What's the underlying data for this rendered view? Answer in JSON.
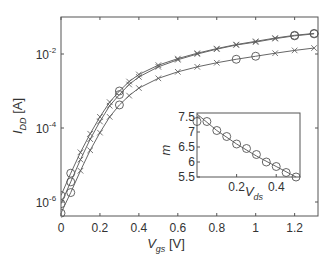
{
  "chart_data": [
    {
      "type": "line",
      "title": "",
      "xlabel": "V_gs [V]",
      "ylabel": "I_DD [A]",
      "xscale": "linear",
      "yscale": "log",
      "xlim": [
        0,
        1.32
      ],
      "ylim": [
        4e-07,
        0.1
      ],
      "xticks": [
        0,
        0.2,
        0.4,
        0.6,
        0.8,
        1,
        1.2
      ],
      "xtick_labels": [
        "0",
        "0.2",
        "0.4",
        "0.6",
        "0.8",
        "1",
        "1.2"
      ],
      "yticks": [
        1e-06,
        0.0001,
        0.01
      ],
      "ytick_labels": [
        "10",
        "10",
        "10"
      ],
      "ytick_exponents": [
        "-6",
        "-4",
        "-2"
      ],
      "grid": false,
      "legend": null,
      "series": [
        {
          "name": "curve-1 (highest)",
          "x": [
            0,
            0.05,
            0.1,
            0.15,
            0.2,
            0.25,
            0.3,
            0.35,
            0.4,
            0.5,
            0.6,
            0.7,
            0.8,
            0.9,
            1.0,
            1.1,
            1.2,
            1.3
          ],
          "y": [
            1.5e-06,
            6e-06,
            2.2e-05,
            7e-05,
            0.0002,
            0.0005,
            0.001,
            0.0018,
            0.0028,
            0.005,
            0.0075,
            0.0105,
            0.014,
            0.018,
            0.022,
            0.027,
            0.032,
            0.036
          ]
        },
        {
          "name": "curve-2 (middle)",
          "x": [
            0,
            0.05,
            0.1,
            0.15,
            0.2,
            0.25,
            0.3,
            0.35,
            0.4,
            0.5,
            0.6,
            0.7,
            0.8,
            0.9,
            1.0,
            1.1,
            1.2,
            1.3
          ],
          "y": [
            9e-07,
            3.5e-06,
            1.4e-05,
            5e-05,
            0.00015,
            0.0004,
            0.0008,
            0.0015,
            0.0024,
            0.0045,
            0.007,
            0.01,
            0.0135,
            0.0175,
            0.021,
            0.026,
            0.031,
            0.035
          ]
        },
        {
          "name": "curve-3 (lowest)",
          "x": [
            0,
            0.05,
            0.1,
            0.15,
            0.2,
            0.25,
            0.3,
            0.35,
            0.4,
            0.5,
            0.6,
            0.7,
            0.8,
            0.9,
            1.0,
            1.1,
            1.2,
            1.3
          ],
          "y": [
            5e-07,
            1.8e-06,
            7e-06,
            2.5e-05,
            7.5e-05,
            0.0002,
            0.00042,
            0.00075,
            0.0012,
            0.0022,
            0.0033,
            0.0045,
            0.0058,
            0.0072,
            0.0087,
            0.0105,
            0.0125,
            0.0145
          ]
        }
      ]
    },
    {
      "type": "line",
      "title": "",
      "xlabel": "V_ds",
      "ylabel": "m",
      "xlim": [
        0,
        0.52
      ],
      "ylim": [
        5.5,
        7.6
      ],
      "xticks": [
        0.2,
        0.4
      ],
      "xtick_labels": [
        "0.2",
        "0.4"
      ],
      "yticks": [
        5.5,
        6,
        6.5,
        7,
        7.5
      ],
      "ytick_labels": [
        "5.5",
        "6",
        "6.5",
        "7",
        "7.5"
      ],
      "grid": false,
      "series": [
        {
          "name": "fit",
          "x": [
            0,
            0.1,
            0.2,
            0.3,
            0.4,
            0.5
          ],
          "y": [
            7.6,
            7.05,
            6.6,
            6.2,
            5.85,
            5.5
          ]
        },
        {
          "name": "measured",
          "marker": "circle",
          "x": [
            0.0,
            0.05,
            0.1,
            0.15,
            0.2,
            0.25,
            0.3,
            0.35,
            0.4,
            0.45,
            0.5
          ],
          "y": [
            7.35,
            7.35,
            7.05,
            6.85,
            6.6,
            6.45,
            6.25,
            6.0,
            5.85,
            5.65,
            5.5
          ]
        }
      ]
    }
  ],
  "labels": {
    "main_xlabel_v": "V",
    "main_xlabel_sub": "gs",
    "main_xlabel_unit": " [V]",
    "main_ylabel_i": "I",
    "main_ylabel_sub": "DD",
    "main_ylabel_unit": " [A]",
    "inset_xlabel_v": "V",
    "inset_xlabel_sub": "ds",
    "inset_ylabel": "m"
  },
  "colors": {
    "axis": "#555555",
    "line": "#666666",
    "marker": "#555555",
    "text": "#333333"
  }
}
